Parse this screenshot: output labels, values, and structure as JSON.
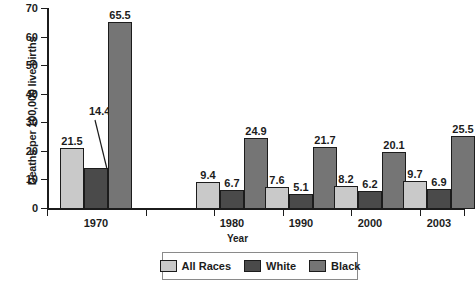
{
  "chart_data": {
    "type": "bar",
    "title": "",
    "subtitle": "",
    "xlabel": "Year",
    "ylabel": "Deaths per 100,000 live births",
    "categories": [
      "1970",
      "1980",
      "1990",
      "2000",
      "2003"
    ],
    "series": [
      {
        "name": "All Races",
        "color": "#c9c9c9",
        "values": [
          21.5,
          9.4,
          7.6,
          8.2,
          9.7
        ]
      },
      {
        "name": "White",
        "color": "#4a4a4a",
        "values": [
          14.4,
          6.7,
          5.1,
          6.2,
          6.9
        ]
      },
      {
        "name": "Black",
        "color": "#757575",
        "values": [
          65.5,
          24.9,
          21.7,
          20.1,
          25.5
        ]
      }
    ],
    "ylim": [
      0,
      70
    ],
    "yticks": [
      0,
      10,
      20,
      30,
      40,
      50,
      60,
      70
    ],
    "ytick_labels": [
      "0",
      "10",
      "20",
      "30",
      "40",
      "50",
      "60",
      "70"
    ],
    "grid": false,
    "legend_position": "bottom",
    "data_labels": [
      [
        "21.5",
        "14.4",
        "65.5"
      ],
      [
        "9.4",
        "6.7",
        "24.9"
      ],
      [
        "7.6",
        "5.1",
        "21.7"
      ],
      [
        "8.2",
        "6.2",
        "20.1"
      ],
      [
        "9.7",
        "6.9",
        "25.5"
      ]
    ],
    "annotations": [
      {
        "label": "14.4",
        "note": "leader line from label down-right to top of White bar in 1970 group"
      }
    ]
  },
  "legend": {
    "items": [
      {
        "label": "All Races",
        "color": "#c9c9c9"
      },
      {
        "label": "White",
        "color": "#4a4a4a"
      },
      {
        "label": "Black",
        "color": "#757575"
      }
    ]
  }
}
